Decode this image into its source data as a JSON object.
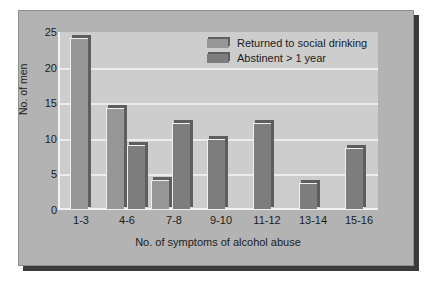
{
  "chart_data": {
    "type": "bar",
    "title": "",
    "xlabel": "No. of symptoms of alcohol abuse",
    "ylabel": "No. of men",
    "ylim": [
      0,
      25
    ],
    "yticks": [
      0,
      5,
      10,
      15,
      20,
      25
    ],
    "grid": true,
    "legend_position": "top-right",
    "categories": [
      "1-3",
      "4-6",
      "7-8",
      "9-10",
      "11-12",
      "13-14",
      "15-16"
    ],
    "series": [
      {
        "name": "Returned to social drinking",
        "color": "#969696",
        "values": [
          24.5,
          14.5,
          4.3,
          null,
          null,
          null,
          null
        ]
      },
      {
        "name": "Abstinent > 1 year",
        "color": "#7d7d7d",
        "values": [
          null,
          9.3,
          12.4,
          10.1,
          12.4,
          3.8,
          8.8
        ]
      }
    ]
  },
  "axes": {
    "y_title": "No. of men",
    "x_title": "No. of symptoms of alcohol abuse",
    "y_ticks": [
      "0",
      "5",
      "10",
      "15",
      "20",
      "25"
    ],
    "x_ticks": [
      "1-3",
      "4-6",
      "7-8",
      "9-10",
      "11-12",
      "13-14",
      "15-16"
    ]
  },
  "legend": {
    "items": [
      {
        "label": "Returned to social drinking",
        "swatch": "series-1-swatch"
      },
      {
        "label": "Abstinent > 1 year",
        "swatch": "series-2-swatch"
      }
    ]
  },
  "colors": {
    "page_background": "#ffffff",
    "figure_background": "#b3b3b3",
    "plot_background": "#cdcdcd",
    "gridline": "#ececec",
    "series_1": "#969696",
    "series_2": "#7d7d7d",
    "bar_edge_dark": "#5e5e5e",
    "text": "#1c1c1c",
    "shadow": "#3a3a3a"
  }
}
